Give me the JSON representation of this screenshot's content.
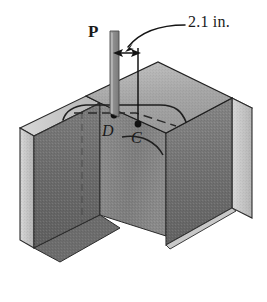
{
  "figure": {
    "labels": {
      "load": "P",
      "dimension": "2.1 in.",
      "point_left": "D",
      "point_right": "C"
    },
    "icons": {
      "load_bar": "vertical-load-bar-icon",
      "leader": "curved-leader-arrow-icon",
      "dimension_arrow": "double-headed-dimension-arrow-icon",
      "point_marker": "point-marker-dot-icon"
    },
    "colors": {
      "background": "#ffffff",
      "ink": "#1a1a1a",
      "top_flange_face": "#a9a9a9",
      "web_face": "#8c8c8c",
      "flange_front_dark": "#6f6f6f",
      "flange_front_darker": "#5e5e5e",
      "edge_highlight": "#d2d2d2",
      "edge_mid": "#bdbdbd",
      "load_bar": "#8d8d8d"
    }
  }
}
